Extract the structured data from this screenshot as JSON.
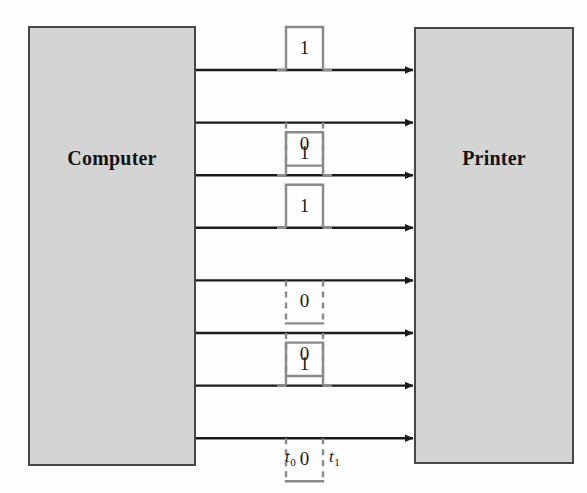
{
  "diagram": {
    "sender": {
      "label": "Computer"
    },
    "receiver": {
      "label": "Printer"
    },
    "time_axis": {
      "start_label": "t",
      "start_sub": "0",
      "end_label": "t",
      "end_sub": "1"
    },
    "colors": {
      "box_fill": "#d4d4d4",
      "box_border": "#474747",
      "line": "#1a1a1a",
      "pulse": "#8a8a8a",
      "text": "#141414",
      "background": "#fdfdfd"
    },
    "bits": [
      {
        "index": 0,
        "value": "1",
        "direction": "up"
      },
      {
        "index": 1,
        "value": "0",
        "direction": "down"
      },
      {
        "index": 2,
        "value": "1",
        "direction": "up"
      },
      {
        "index": 3,
        "value": "1",
        "direction": "up"
      },
      {
        "index": 4,
        "value": "0",
        "direction": "down"
      },
      {
        "index": 5,
        "value": "0",
        "direction": "down"
      },
      {
        "index": 6,
        "value": "1",
        "direction": "up"
      },
      {
        "index": 7,
        "value": "0",
        "direction": "down"
      }
    ]
  },
  "chart_data": {
    "type": "line",
    "xlabel": "",
    "ylabel": "",
    "categories": [
      "line1",
      "line2",
      "line3",
      "line4",
      "line5",
      "line6",
      "line7",
      "line8"
    ],
    "values": [
      1,
      0,
      1,
      1,
      0,
      0,
      1,
      0
    ],
    "annotations": [
      "t0",
      "t1"
    ],
    "series": [
      {
        "name": "bit stream",
        "values": [
          1,
          0,
          1,
          1,
          0,
          0,
          1,
          0
        ]
      }
    ],
    "grid": false,
    "legend": "none"
  }
}
